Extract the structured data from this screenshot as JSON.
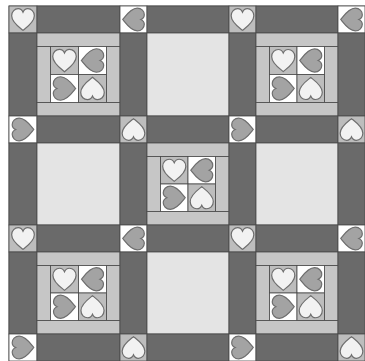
{
  "quilt": {
    "title": "Heart four-patch quilt with sashing and cornerstones",
    "colors": {
      "background": "#ffffff",
      "sashing": "#6a6a6a",
      "plain_block": "#e4e4e4",
      "frame_strip": "#c6c6c6",
      "cell_gray": "#bdbdbd",
      "cell_white": "#ffffff",
      "heart_light": "#f2f2f2",
      "heart_gray": "#a3a3a3",
      "outline": "#4a4a4a",
      "heart_outline": "#6e6e6e"
    },
    "grid": {
      "col_edges": [
        9,
        37,
        120,
        147,
        229,
        256,
        338,
        365
      ],
      "row_edges": [
        6,
        33,
        116,
        143,
        225,
        252,
        334,
        361
      ]
    },
    "cornerstone_rows": [
      [
        "light-up",
        "gray-left",
        "light-up",
        "gray-left"
      ],
      [
        "gray-right",
        "light-down",
        "gray-right",
        "light-down"
      ],
      [
        "light-up",
        "gray-left",
        "light-up",
        "gray-left"
      ],
      [
        "gray-right",
        "light-down",
        "gray-right",
        "light-down"
      ]
    ],
    "block_rows": [
      [
        "heart-four-patch",
        "plain",
        "heart-four-patch"
      ],
      [
        "plain",
        "heart-four-patch",
        "plain"
      ],
      [
        "heart-four-patch",
        "plain",
        "heart-four-patch"
      ]
    ],
    "four_patch": [
      [
        "light-up",
        "gray-left"
      ],
      [
        "gray-right",
        "light-down"
      ]
    ]
  }
}
